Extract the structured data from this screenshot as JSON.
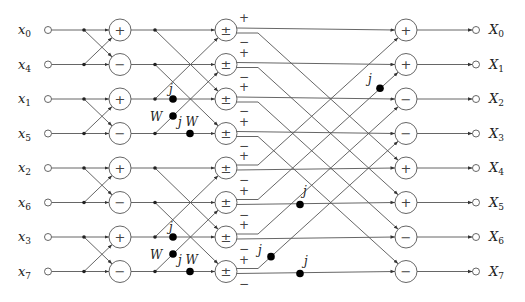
{
  "inputs": [
    "x0",
    "x4",
    "x1",
    "x5",
    "x2",
    "x6",
    "x3",
    "x7"
  ],
  "input_labels": [
    {
      "base": "x",
      "sub": "0"
    },
    {
      "base": "x",
      "sub": "4"
    },
    {
      "base": "x",
      "sub": "1"
    },
    {
      "base": "x",
      "sub": "5"
    },
    {
      "base": "x",
      "sub": "2"
    },
    {
      "base": "x",
      "sub": "6"
    },
    {
      "base": "x",
      "sub": "3"
    },
    {
      "base": "x",
      "sub": "7"
    }
  ],
  "output_labels": [
    {
      "base": "X",
      "sub": "0"
    },
    {
      "base": "X",
      "sub": "1"
    },
    {
      "base": "X",
      "sub": "2"
    },
    {
      "base": "X",
      "sub": "3"
    },
    {
      "base": "X",
      "sub": "4"
    },
    {
      "base": "X",
      "sub": "5"
    },
    {
      "base": "X",
      "sub": "6"
    },
    {
      "base": "X",
      "sub": "7"
    }
  ],
  "stage1_ops": [
    "+",
    "−",
    "+",
    "−",
    "+",
    "−",
    "+",
    "−"
  ],
  "stage2_ops": [
    "±",
    "±",
    "±",
    "±",
    "±",
    "±",
    "±",
    "±"
  ],
  "stage2_output_signs": {
    "plus": "+",
    "minus": "−"
  },
  "stage3_ops": [
    "+",
    "+",
    "−",
    "−",
    "+",
    "+",
    "−",
    "−"
  ],
  "twiddles": {
    "stage2": [
      {
        "label": "j",
        "row": 2,
        "type": "straight"
      },
      {
        "label": "W",
        "row": 3,
        "type": "diagonal"
      },
      {
        "label": "j W",
        "row": 3,
        "type": "straight"
      },
      {
        "label": "j",
        "row": 6,
        "type": "straight"
      },
      {
        "label": "W",
        "row": 7,
        "type": "diagonal"
      },
      {
        "label": "j W",
        "row": 7,
        "type": "straight"
      }
    ],
    "stage3": [
      {
        "label": "j",
        "from_row": 5,
        "to_row": 1,
        "type": "diagonal"
      },
      {
        "label": "j",
        "row": 5,
        "type": "straight"
      },
      {
        "label": "j",
        "from_row": 7,
        "to_row": 3,
        "type": "diagonal"
      },
      {
        "label": "j",
        "row": 7,
        "type": "straight"
      }
    ]
  }
}
